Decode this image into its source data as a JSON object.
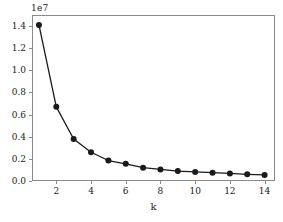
{
  "chart_data": {
    "type": "line",
    "title": "",
    "subtitle": "",
    "xlabel": "k",
    "ylabel": "",
    "y_offset_text": "1e7",
    "y_offset_multiplier": 10000000,
    "x": [
      1,
      2,
      3,
      4,
      5,
      6,
      7,
      8,
      9,
      10,
      11,
      12,
      13,
      14
    ],
    "values": [
      1.41,
      0.67,
      0.38,
      0.26,
      0.185,
      0.155,
      0.12,
      0.105,
      0.09,
      0.082,
      0.075,
      0.068,
      0.06,
      0.055
    ],
    "series": [
      {
        "name": "inertia",
        "values": [
          1.41,
          0.67,
          0.38,
          0.26,
          0.185,
          0.155,
          0.12,
          0.105,
          0.09,
          0.082,
          0.075,
          0.068,
          0.06,
          0.055
        ]
      }
    ],
    "xlim": [
      0.6,
      14.6
    ],
    "ylim": [
      0.0,
      1.5
    ],
    "xticks": [
      2,
      4,
      6,
      8,
      10,
      12,
      14
    ],
    "xtick_labels": [
      "2",
      "4",
      "6",
      "8",
      "10",
      "12",
      "14"
    ],
    "yticks": [
      0.0,
      0.2,
      0.4,
      0.6,
      0.8,
      1.0,
      1.2,
      1.4
    ],
    "ytick_labels": [
      "0.0",
      "0.2",
      "0.4",
      "0.6",
      "0.8",
      "1.0",
      "1.2",
      "1.4"
    ],
    "grid": false,
    "legend": null,
    "legend_position": "none",
    "line_color": "#1a1a1a",
    "marker_color": "#1a1a1a",
    "marker": "circle",
    "frame_color": "#8a8a8a"
  }
}
